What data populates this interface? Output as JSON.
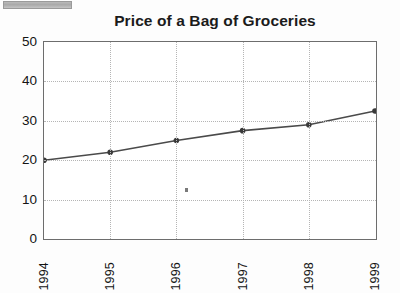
{
  "page": {
    "background_color": "#fdfdfd",
    "scanbar": {
      "name": "scan-artifact-bar",
      "color": "#b0b0b0"
    },
    "speck": {
      "name": "page-speck-artifact",
      "color": "#7a7a7a"
    }
  },
  "chart_data": {
    "type": "line",
    "title": "Price of a Bag of Groceries",
    "xlabel": "",
    "ylabel": "",
    "categories": [
      "1994",
      "1995",
      "1996",
      "1997",
      "1998",
      "1999"
    ],
    "values": [
      20,
      22,
      25,
      27.5,
      29,
      32.5
    ],
    "series": [
      {
        "name": "Price of a Bag of Groceries",
        "values": [
          20,
          22,
          25,
          27.5,
          29,
          32.5
        ]
      }
    ],
    "ylim": [
      0,
      50
    ],
    "yticks": [
      0,
      10,
      20,
      30,
      40,
      50
    ],
    "ytick_labels": [
      "0",
      "10",
      "20",
      "30",
      "40",
      "50"
    ],
    "xtick_labels": [
      "1994",
      "1995",
      "1996",
      "1997",
      "1998",
      "1999"
    ],
    "xtick_rotation": 90,
    "grid": true,
    "grid_style": "dotted",
    "grid_color": "#b5b5b5",
    "legend": false,
    "legend_position": "none",
    "line_color": "#4a4a4a",
    "marker": "circle",
    "marker_color": "#3a3a3a",
    "axis_color": "#6d6d6d",
    "annotations": []
  }
}
